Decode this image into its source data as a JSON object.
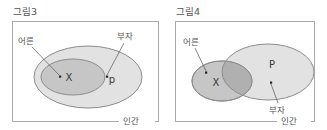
{
  "figure": {
    "panels": [
      {
        "id": "fig3",
        "title": "그림3",
        "universe_label": "인간",
        "set_labels": {
          "inner": "어른",
          "outer": "부자"
        },
        "elements": [
          {
            "name": "X",
            "label": "X",
            "inside": "어른"
          },
          {
            "name": "p",
            "label": "p",
            "inside": "부자"
          }
        ],
        "relation": "subset",
        "description": "어른 ellipse fully contained inside 부자 ellipse"
      },
      {
        "id": "fig4",
        "title": "그림4",
        "universe_label": "인간",
        "set_labels": {
          "inner": "어른",
          "outer": "부자"
        },
        "elements": [
          {
            "name": "X",
            "label": "X",
            "inside": "어른"
          },
          {
            "name": "P",
            "label": "P",
            "inside": "부자"
          }
        ],
        "relation": "overlap",
        "description": "어른 ellipse and 부자 ellipse partially overlap"
      }
    ]
  },
  "colors": {
    "frame_stroke": "#aaaaaa",
    "outer_set_fill": "#e2e2e2",
    "inner_set_fill": "#c6c6c6",
    "set_stroke": "#8c8c8c",
    "text": "#555555",
    "element_text": "#3a3a3a",
    "background": "#ffffff"
  }
}
